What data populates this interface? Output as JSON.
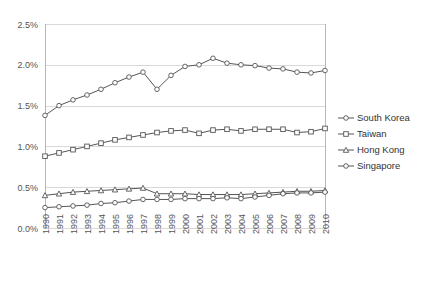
{
  "chart_data": {
    "type": "line",
    "title": "",
    "xlabel": "",
    "ylabel": "",
    "grid": true,
    "legend_position": "right",
    "ylim": [
      0,
      2.5
    ],
    "ytick_labels": [
      "0.0%",
      "0.5%",
      "1.0%",
      "1.5%",
      "2.0%",
      "2.5%"
    ],
    "ytick_values": [
      0,
      0.5,
      1.0,
      1.5,
      2.0,
      2.5
    ],
    "categories": [
      "1990",
      "1991",
      "1992",
      "1993",
      "1994",
      "1995",
      "1996",
      "1997",
      "1998",
      "1999",
      "2000",
      "2001",
      "2002",
      "2003",
      "2004",
      "2005",
      "2006",
      "2007",
      "2008",
      "2009",
      "2010"
    ],
    "series": [
      {
        "name": "South Korea",
        "marker": "circle",
        "color": "#555555",
        "values": [
          1.38,
          1.5,
          1.57,
          1.63,
          1.7,
          1.78,
          1.85,
          1.91,
          1.7,
          1.87,
          1.98,
          2.0,
          2.08,
          2.02,
          2.0,
          1.99,
          1.96,
          1.95,
          1.91,
          1.9,
          1.93
        ]
      },
      {
        "name": "Taiwan",
        "marker": "square",
        "color": "#555555",
        "values": [
          0.88,
          0.92,
          0.96,
          1.0,
          1.04,
          1.08,
          1.11,
          1.14,
          1.17,
          1.19,
          1.2,
          1.16,
          1.2,
          1.21,
          1.19,
          1.21,
          1.21,
          1.21,
          1.17,
          1.18,
          1.22
        ]
      },
      {
        "name": "Hong Kong",
        "marker": "triangle",
        "color": "#555555",
        "values": [
          0.4,
          0.42,
          0.44,
          0.45,
          0.46,
          0.47,
          0.48,
          0.49,
          0.42,
          0.42,
          0.42,
          0.41,
          0.41,
          0.41,
          0.41,
          0.42,
          0.43,
          0.44,
          0.45,
          0.45,
          0.46
        ]
      },
      {
        "name": "Singapore",
        "marker": "circle",
        "color": "#555555",
        "values": [
          0.25,
          0.26,
          0.27,
          0.28,
          0.3,
          0.31,
          0.33,
          0.35,
          0.35,
          0.35,
          0.36,
          0.36,
          0.36,
          0.37,
          0.36,
          0.38,
          0.4,
          0.42,
          0.43,
          0.43,
          0.44
        ]
      }
    ]
  },
  "legend": {
    "items": [
      {
        "label": "South Korea"
      },
      {
        "label": "Taiwan"
      },
      {
        "label": "Hong Kong"
      },
      {
        "label": "Singapore"
      }
    ]
  }
}
